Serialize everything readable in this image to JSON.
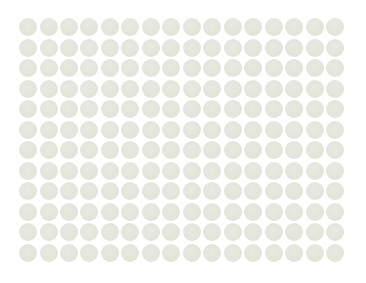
{
  "image": {
    "description": "Uniform grid of pale grey-green circles on white background",
    "background_color": "#ffffff",
    "dot_color": "#e3e5db"
  },
  "grid": {
    "columns": 16,
    "rows": 12,
    "origin_x": 19,
    "origin_y": 18,
    "pitch_x": 20.47,
    "pitch_y": 20.5,
    "dot_diameter": 18
  }
}
